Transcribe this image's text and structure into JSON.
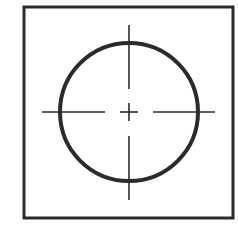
{
  "diagram": {
    "colors": {
      "background": "#ffffff",
      "stroke": "#2b2b2b"
    },
    "frame": {
      "x": 24,
      "y": 7,
      "width": 209,
      "height": 211,
      "stroke_width": 3
    },
    "circle": {
      "cx": 129,
      "cy": 112,
      "r": 69,
      "stroke_width": 4
    },
    "center_mark": {
      "cx": 129,
      "cy": 112,
      "cross_half_length": 9,
      "stroke_width": 1.6,
      "horizontal_left_dash": {
        "x1": 42,
        "x2": 105
      },
      "horizontal_right_dash": {
        "x1": 153,
        "x2": 215
      },
      "vertical_top_dash": {
        "y1": 25,
        "y2": 89
      },
      "vertical_bottom_dash": {
        "y1": 136,
        "y2": 200
      }
    }
  }
}
